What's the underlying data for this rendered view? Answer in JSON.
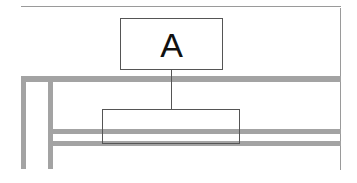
{
  "diagram": {
    "top_box": {
      "label": "A"
    },
    "bottom_box": {
      "label": ""
    },
    "colors": {
      "frame": "#9a9a9a",
      "bars": "#a3a3a3",
      "box_border": "#555555",
      "text": "#111111"
    }
  }
}
